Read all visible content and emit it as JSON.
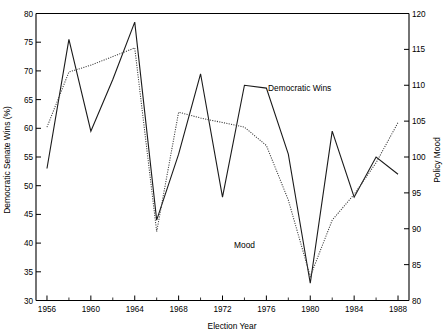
{
  "chart_data": {
    "type": "line",
    "title": "",
    "xlabel": "Election Year",
    "ylabel": "Democratic Senate Wins (%)",
    "ylabel_right": "Policy Mood",
    "xlim": [
      1955,
      1989
    ],
    "ylim": [
      30,
      80
    ],
    "ylim_right": [
      80,
      120
    ],
    "grid": false,
    "legend_position": "inline-annotation",
    "x_ticks_major": [
      1956,
      1960,
      1964,
      1968,
      1972,
      1976,
      1980,
      1984,
      1988
    ],
    "x_ticks_minor": [
      1958,
      1962,
      1966,
      1970,
      1974,
      1978,
      1982,
      1986
    ],
    "y_ticks_left": [
      30,
      35,
      40,
      45,
      50,
      55,
      60,
      65,
      70,
      75,
      80
    ],
    "y_ticks_right": [
      80,
      85,
      90,
      95,
      100,
      105,
      110,
      115,
      120
    ],
    "x": [
      1956,
      1958,
      1960,
      1962,
      1964,
      1966,
      1968,
      1970,
      1972,
      1974,
      1976,
      1978,
      1980,
      1982,
      1984,
      1986,
      1988
    ],
    "series": [
      {
        "name": "Democratic Wins",
        "style": "solid",
        "axis": "left",
        "annotation": "Democratic Wins",
        "values": [
          53.0,
          75.5,
          59.5,
          68.5,
          78.5,
          44.0,
          55.5,
          69.5,
          48.0,
          67.5,
          67.0,
          55.5,
          33.0,
          59.5,
          48.0,
          55.0,
          52.0
        ]
      },
      {
        "name": "Mood",
        "style": "dotted",
        "axis": "right",
        "annotation": "Mood",
        "values_left_scale": [
          60.2,
          69.8,
          71.0,
          72.5,
          74.0,
          42.0,
          62.8,
          61.8,
          61.0,
          60.2,
          57.0,
          47.5,
          34.2,
          44.0,
          48.5,
          54.0,
          61.0
        ],
        "values_right_scale": [
          104.2,
          111.8,
          112.8,
          114.0,
          115.2,
          89.6,
          106.2,
          105.4,
          104.8,
          104.2,
          101.6,
          94.0,
          83.4,
          91.2,
          94.8,
          99.2,
          104.8
        ]
      }
    ],
    "annotations": [
      {
        "text": "Democratic Wins",
        "x_px": 268,
        "y_px": 91
      },
      {
        "text": "Mood",
        "x_px": 234,
        "y_px": 248
      }
    ]
  },
  "axes": {
    "x_title": "Election Year",
    "y_left_title": "Democratic Senate Wins (%)",
    "y_right_title": "Policy Mood",
    "x_tick_labels": [
      "1956",
      "1960",
      "1964",
      "1968",
      "1972",
      "1976",
      "1980",
      "1984",
      "1988"
    ],
    "y_left_tick_labels": [
      "80",
      "75",
      "70",
      "65",
      "60",
      "55",
      "50",
      "45",
      "40",
      "35",
      "30"
    ],
    "y_right_tick_labels": [
      "120",
      "115",
      "110",
      "105",
      "100",
      "95",
      "90",
      "85",
      "80"
    ]
  },
  "colors": {
    "background": "#ffffff",
    "axis": "#000000",
    "series_solid": "#1a1a1a",
    "series_dotted": "#3a3a3a"
  }
}
